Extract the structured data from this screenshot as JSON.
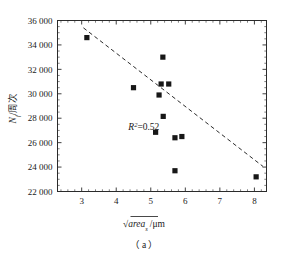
{
  "chart_data": {
    "type": "scatter",
    "title": "",
    "subtitle": "",
    "xlabel": "√areaₛ /μm",
    "xlabel_parts": {
      "radical": "√",
      "base": "area",
      "subscript": "s",
      "unit": "/μm"
    },
    "ylabel": "Nᶠ/周次",
    "ylabel_parts": {
      "symbol": "N",
      "subscript": "f",
      "unit": "/周次"
    },
    "xlim": [
      2.3,
      8.35
    ],
    "ylim": [
      22000,
      36000
    ],
    "xticks": [
      3,
      4,
      5,
      6,
      7,
      8
    ],
    "xtick_labels": [
      "3",
      "4",
      "5",
      "6",
      "7",
      "8"
    ],
    "yticks": [
      22000,
      24000,
      26000,
      28000,
      30000,
      32000,
      34000,
      36000
    ],
    "ytick_labels": [
      "22 000",
      "24 000",
      "26 000",
      "28 000",
      "30 000",
      "32 000",
      "34 000",
      "36 000"
    ],
    "x_minor_per_major": 5,
    "y_minor_per_major": 4,
    "grid": false,
    "legend": null,
    "marker": "filled-square",
    "marker_color": "#171717",
    "points": [
      {
        "x": 3.15,
        "y": 34600
      },
      {
        "x": 4.5,
        "y": 30500
      },
      {
        "x": 5.35,
        "y": 33000
      },
      {
        "x": 5.3,
        "y": 30800
      },
      {
        "x": 5.52,
        "y": 30800
      },
      {
        "x": 5.24,
        "y": 29900
      },
      {
        "x": 5.36,
        "y": 28150
      },
      {
        "x": 5.14,
        "y": 26850
      },
      {
        "x": 5.7,
        "y": 26400
      },
      {
        "x": 5.9,
        "y": 26500
      },
      {
        "x": 5.7,
        "y": 23700
      },
      {
        "x": 8.05,
        "y": 23200
      }
    ],
    "trendline": {
      "style": "dashed",
      "color": "#2b2b2b",
      "x_start": 3.05,
      "y_start": 35400,
      "x_end": 8.25,
      "y_end": 24050
    },
    "annotations": [
      {
        "name": "r-squared",
        "text": "R²=0.52",
        "symbol": "R",
        "exponent": "2",
        "value": "=0.52",
        "x": 4.35,
        "y": 27000
      }
    ]
  },
  "caption": {
    "text": "（ a ）",
    "label": "( a )"
  }
}
